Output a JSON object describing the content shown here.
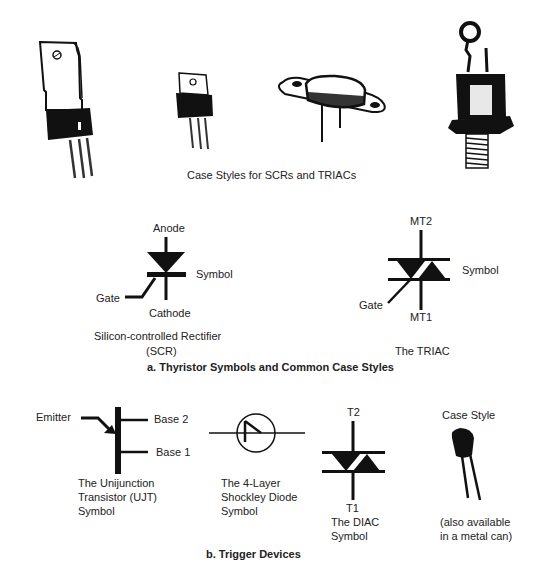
{
  "section_a": {
    "case_styles_caption": "Case Styles for SCRs and TRIACs",
    "case_packages": [
      {
        "name": "to-220-large"
      },
      {
        "name": "to-220-small"
      },
      {
        "name": "to-3-metal-can"
      },
      {
        "name": "stud-mount"
      }
    ],
    "scr": {
      "anode": "Anode",
      "cathode": "Cathode",
      "gate": "Gate",
      "symbol": "Symbol",
      "caption_line1": "Silicon-controlled Rectifier",
      "caption_line2": "(SCR)"
    },
    "triac": {
      "mt2": "MT2",
      "mt1": "MT1",
      "gate": "Gate",
      "symbol": "Symbol",
      "caption": "The TRIAC"
    },
    "heading": "a. Thyristor Symbols and Common Case Styles"
  },
  "section_b": {
    "ujt": {
      "emitter": "Emitter",
      "base2": "Base 2",
      "base1": "Base 1",
      "caption_line1": "The Unijunction",
      "caption_line2": "Transistor (UJT)",
      "caption_line3": "Symbol"
    },
    "shockley": {
      "caption_line1": "The 4-Layer",
      "caption_line2": "Shockley Diode",
      "caption_line3": "Symbol"
    },
    "diac": {
      "t2": "T2",
      "t1": "T1",
      "caption_line1": "The DIAC",
      "caption_line2": "Symbol"
    },
    "case_style": {
      "title": "Case Style",
      "note_line1": "(also available",
      "note_line2": "in a metal can)"
    },
    "heading": "b. Trigger Devices"
  }
}
